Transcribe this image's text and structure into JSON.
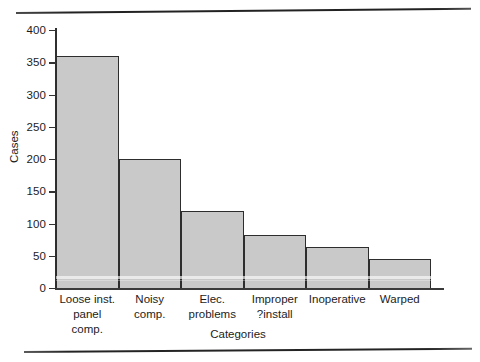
{
  "chart_data": {
    "type": "bar",
    "title": "",
    "xlabel": "Categories",
    "ylabel": "Cases",
    "ylim": [
      0,
      400
    ],
    "yticks": [
      0,
      50,
      100,
      150,
      200,
      250,
      300,
      350,
      400
    ],
    "grid": false,
    "legend": null,
    "categories": [
      "Loose inst. panel comp.",
      "Noisy comp.",
      "Elec. problems",
      "Improper ?install",
      "Inoperative",
      "Warped"
    ],
    "category_lines": [
      [
        "Loose inst.",
        "panel comp."
      ],
      [
        "Noisy",
        "comp."
      ],
      [
        "Elec.",
        "problems"
      ],
      [
        "Improper",
        "?install"
      ],
      [
        "Inoperative",
        ""
      ],
      [
        "Warped",
        ""
      ]
    ],
    "values": [
      360,
      200,
      120,
      82,
      63,
      45
    ]
  },
  "axis": {
    "y_label": "Cases",
    "x_label": "Categories",
    "y_tick_labels": [
      "400",
      "350",
      "300",
      "250",
      "200",
      "150",
      "100",
      "50",
      "0"
    ]
  },
  "colors": {
    "bar_fill": "#c9c9c9",
    "bar_stroke": "#2d2d2d",
    "axis": "#2f2f2f",
    "text": "#1c1c1c",
    "page": "#ffffff"
  },
  "page": {
    "bottom_caption": ""
  }
}
